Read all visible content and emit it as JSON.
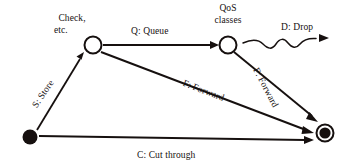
{
  "diagram": {
    "ink_color": "#16100f",
    "background_color": "#ffffff",
    "nodes": [
      {
        "id": "start",
        "kind": "initial-node",
        "label": "",
        "cx": 30,
        "cy": 137,
        "r": 7
      },
      {
        "id": "check",
        "kind": "state-node",
        "label": "Check,\netc.",
        "label_line1": "Check,",
        "label_line2": "etc.",
        "cx": 93,
        "cy": 45,
        "r": 9
      },
      {
        "id": "qos",
        "kind": "state-node",
        "label": "QoS\nclasses",
        "label_line1": "QoS",
        "label_line2": "classes",
        "cx": 228,
        "cy": 45,
        "r": 9
      },
      {
        "id": "end",
        "kind": "final-node",
        "label": "",
        "cx": 325,
        "cy": 133,
        "r": 9
      }
    ],
    "edges": [
      {
        "id": "store",
        "label": "S: Store",
        "from": "start",
        "to": "check",
        "style": "straight",
        "rotation_deg": -55
      },
      {
        "id": "queue",
        "label": "Q: Queue",
        "from": "check",
        "to": "qos",
        "style": "straight",
        "rotation_deg": 0
      },
      {
        "id": "drop",
        "label": "D: Drop",
        "from": "qos",
        "to": "none",
        "style": "wavy",
        "rotation_deg": 0
      },
      {
        "id": "forward-1",
        "label": "F: Forward",
        "from": "check",
        "to": "end",
        "style": "straight",
        "rotation_deg": 21
      },
      {
        "id": "forward-2",
        "label": "F: Forward",
        "from": "qos",
        "to": "end",
        "style": "straight",
        "rotation_deg": 62
      },
      {
        "id": "cut-through",
        "label": "C: Cut through",
        "from": "start",
        "to": "end",
        "style": "straight",
        "rotation_deg": 0
      }
    ]
  }
}
